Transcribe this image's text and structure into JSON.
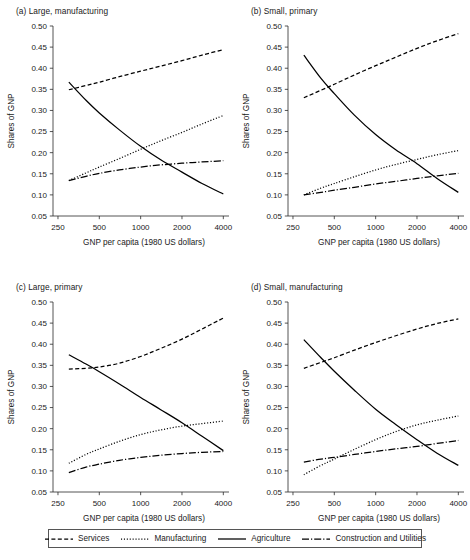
{
  "figure": {
    "width": 470,
    "height": 560,
    "background": "#ffffff",
    "ink_color": "#000000"
  },
  "axis": {
    "xlabel": "GNP per capita (1980 US dollars)",
    "ylabel": "Shares of GNP",
    "xticks": [
      250,
      500,
      1000,
      2000,
      4000
    ],
    "xtick_labels": [
      "250",
      "500",
      "1000",
      "2000",
      "4000"
    ],
    "xscale": "log",
    "xlim": [
      230,
      4400
    ],
    "yticks": [
      0.05,
      0.1,
      0.15,
      0.2,
      0.25,
      0.3,
      0.35,
      0.4,
      0.45,
      0.5
    ],
    "ytick_labels": [
      "0.05",
      "0.10",
      "0.15",
      "0.20",
      "0.25",
      "0.30",
      "0.35",
      "0.40",
      "0.45",
      "0.50"
    ],
    "ylim": [
      0.05,
      0.5
    ],
    "grid": false
  },
  "legend": {
    "position": "bottom",
    "entries": [
      {
        "label": "Services",
        "dash": "4,2.4",
        "style": "dashed"
      },
      {
        "label": "Manufacturing",
        "dash": "1.1,1.8",
        "style": "dotted"
      },
      {
        "label": "Agriculture",
        "dash": "none",
        "style": "solid"
      },
      {
        "label": "Construction and Utilities",
        "dash": "7,2,1.2,2",
        "style": "dash-dot"
      }
    ]
  },
  "chart_data": [
    {
      "id": "a",
      "type": "line",
      "title": "(a) Large, manufacturing",
      "xlabel": "GNP per capita (1980 US dollars)",
      "ylabel": "Shares of GNP",
      "xscale": "log",
      "xlim": [
        230,
        4400
      ],
      "ylim": [
        0.05,
        0.5
      ],
      "x": [
        300,
        400,
        500,
        700,
        1000,
        1400,
        2000,
        2800,
        4000
      ],
      "series": [
        {
          "name": "Services",
          "dash": "4,2.4",
          "values": [
            0.349,
            0.359,
            0.367,
            0.38,
            0.393,
            0.405,
            0.418,
            0.431,
            0.444
          ]
        },
        {
          "name": "Manufacturing",
          "dash": "1.1,1.8",
          "values": [
            0.134,
            0.152,
            0.166,
            0.186,
            0.208,
            0.228,
            0.248,
            0.268,
            0.288
          ]
        },
        {
          "name": "Agriculture",
          "dash": "none",
          "values": [
            0.367,
            0.324,
            0.294,
            0.254,
            0.215,
            0.183,
            0.154,
            0.127,
            0.102
          ]
        },
        {
          "name": "Construction and Utilities",
          "dash": "7,2,1.2,2",
          "values": [
            0.134,
            0.144,
            0.151,
            0.159,
            0.166,
            0.171,
            0.175,
            0.178,
            0.181
          ]
        }
      ]
    },
    {
      "id": "b",
      "type": "line",
      "title": "(b) Small, primary",
      "xlabel": "GNP per capita (1980 US dollars)",
      "ylabel": "Shares of GNP",
      "xscale": "log",
      "xlim": [
        230,
        4400
      ],
      "ylim": [
        0.05,
        0.5
      ],
      "x": [
        300,
        400,
        500,
        700,
        1000,
        1400,
        2000,
        2800,
        4000
      ],
      "series": [
        {
          "name": "Services",
          "dash": "4,2.4",
          "values": [
            0.33,
            0.348,
            0.362,
            0.384,
            0.406,
            0.426,
            0.447,
            0.465,
            0.482
          ]
        },
        {
          "name": "Manufacturing",
          "dash": "1.1,1.8",
          "values": [
            0.1,
            0.116,
            0.127,
            0.143,
            0.159,
            0.172,
            0.184,
            0.195,
            0.205
          ]
        },
        {
          "name": "Agriculture",
          "dash": "none",
          "values": [
            0.431,
            0.376,
            0.34,
            0.289,
            0.243,
            0.207,
            0.174,
            0.139,
            0.106
          ]
        },
        {
          "name": "Construction and Utilities",
          "dash": "7,2,1.2,2",
          "values": [
            0.1,
            0.106,
            0.111,
            0.118,
            0.126,
            0.132,
            0.139,
            0.145,
            0.151
          ]
        }
      ]
    },
    {
      "id": "c",
      "type": "line",
      "title": "(c) Large, primary",
      "xlabel": "GNP per capita (1980 US dollars)",
      "ylabel": "Shares of GNP",
      "xscale": "log",
      "xlim": [
        230,
        4400
      ],
      "ylim": [
        0.05,
        0.5
      ],
      "x": [
        300,
        400,
        500,
        700,
        1000,
        1400,
        2000,
        2800,
        4000
      ],
      "series": [
        {
          "name": "Services",
          "dash": "4,2.4",
          "values": [
            0.341,
            0.343,
            0.346,
            0.355,
            0.371,
            0.39,
            0.412,
            0.436,
            0.462
          ]
        },
        {
          "name": "Manufacturing",
          "dash": "1.1,1.8",
          "values": [
            0.118,
            0.139,
            0.152,
            0.17,
            0.186,
            0.197,
            0.206,
            0.212,
            0.218
          ]
        },
        {
          "name": "Agriculture",
          "dash": "none",
          "values": [
            0.375,
            0.353,
            0.335,
            0.306,
            0.274,
            0.245,
            0.214,
            0.182,
            0.148
          ]
        },
        {
          "name": "Construction and Utilities",
          "dash": "7,2,1.2,2",
          "values": [
            0.096,
            0.109,
            0.116,
            0.125,
            0.132,
            0.137,
            0.141,
            0.144,
            0.146
          ]
        }
      ]
    },
    {
      "id": "d",
      "type": "line",
      "title": "(d) Small, manufacturing",
      "xlabel": "GNP per capita (1980 US dollars)",
      "ylabel": "Shares of GNP",
      "xscale": "log",
      "xlim": [
        230,
        4400
      ],
      "ylim": [
        0.05,
        0.5
      ],
      "x": [
        300,
        400,
        500,
        700,
        1000,
        1400,
        2000,
        2800,
        4000
      ],
      "series": [
        {
          "name": "Services",
          "dash": "4,2.4",
          "values": [
            0.343,
            0.357,
            0.368,
            0.386,
            0.404,
            0.42,
            0.436,
            0.449,
            0.46
          ]
        },
        {
          "name": "Manufacturing",
          "dash": "1.1,1.8",
          "values": [
            0.091,
            0.113,
            0.128,
            0.151,
            0.174,
            0.193,
            0.209,
            0.22,
            0.23
          ]
        },
        {
          "name": "Agriculture",
          "dash": "none",
          "values": [
            0.411,
            0.368,
            0.336,
            0.291,
            0.246,
            0.21,
            0.174,
            0.142,
            0.113
          ]
        },
        {
          "name": "Construction and Utilities",
          "dash": "7,2,1.2,2",
          "values": [
            0.121,
            0.128,
            0.132,
            0.139,
            0.146,
            0.152,
            0.158,
            0.165,
            0.172
          ]
        }
      ]
    }
  ]
}
